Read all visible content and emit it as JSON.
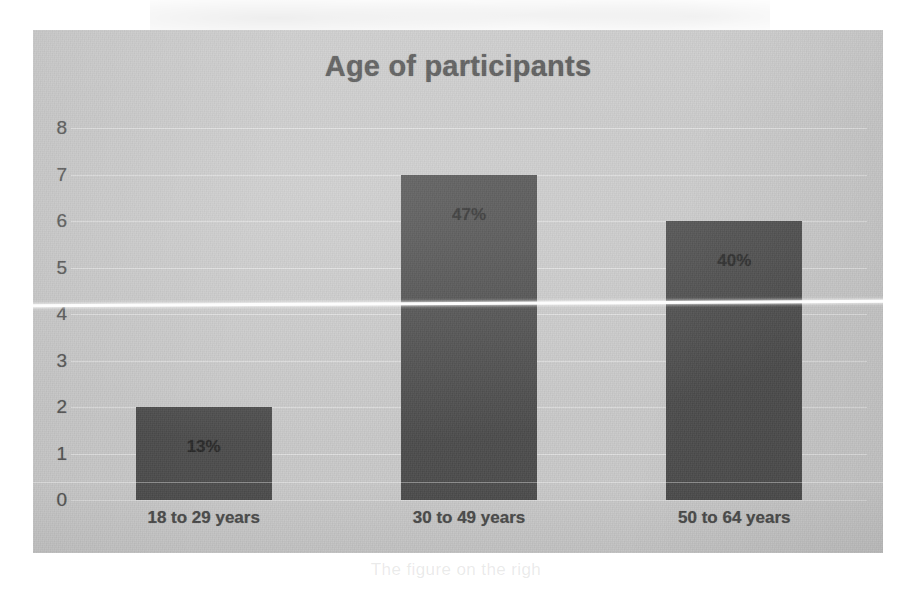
{
  "chart": {
    "title": "Age of participants"
  },
  "chart_data": {
    "type": "bar",
    "title": "Age of participants",
    "xlabel": "",
    "ylabel": "",
    "ylim": [
      0,
      8
    ],
    "grid": true,
    "legend": "none",
    "categories": [
      "18 to 29 years",
      "30 to 49 years",
      "50 to 64 years"
    ],
    "values": [
      2,
      7,
      6
    ],
    "data_labels": [
      "13%",
      "47%",
      "40%"
    ],
    "ytick_labels": [
      "0",
      "1",
      "2",
      "3",
      "4",
      "5",
      "6",
      "7",
      "8"
    ],
    "ytick_values": [
      0,
      1,
      2,
      3,
      4,
      5,
      6,
      7,
      8
    ],
    "bar_color": "#4c4c4c",
    "plot_background": "#c9c9c9",
    "title_color": "#4f4f4f"
  },
  "artifacts": {
    "ghost_text": "The figure on the righ"
  }
}
